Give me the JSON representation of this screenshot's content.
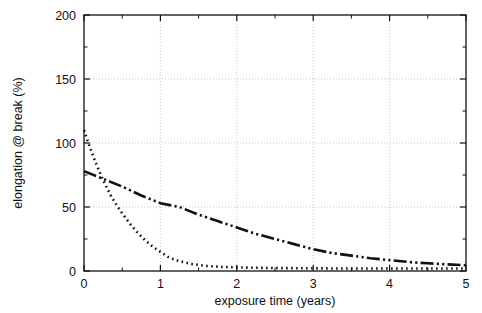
{
  "figure": {
    "clipped_top_text": "",
    "background": "#ffffff",
    "ink": "#111111",
    "grid_color": "#bdbdbd"
  },
  "chart_data": {
    "type": "line",
    "title": "",
    "xlabel": "exposure time (years)",
    "ylabel": "elongation @ break (%)",
    "xlim": [
      0,
      5
    ],
    "ylim": [
      0,
      200
    ],
    "xticks": [
      0,
      1,
      2,
      3,
      4,
      5
    ],
    "xticklabels": [
      "0",
      "1",
      "2",
      "3",
      "4",
      "5"
    ],
    "yticks": [
      0,
      50,
      100,
      150,
      200
    ],
    "yticklabels": [
      "0",
      "50",
      "100",
      "150",
      "200"
    ],
    "grid": true,
    "grid_style": "dotted",
    "gridlines_x": [
      1,
      2,
      3,
      4
    ],
    "gridlines_y": [
      50,
      100,
      150
    ],
    "legend": "none",
    "series": [
      {
        "name": "series-1",
        "linestyle": "dotted",
        "color": "#111111",
        "x": [
          0.0,
          0.05,
          0.1,
          0.15,
          0.2,
          0.25,
          0.3,
          0.35,
          0.4,
          0.5,
          0.6,
          0.7,
          0.8,
          0.9,
          1.0,
          1.1,
          1.2,
          1.4,
          1.6,
          1.8,
          2.0,
          2.25,
          2.5,
          2.75,
          3.0,
          3.25,
          3.5,
          3.75,
          4.0,
          4.25,
          4.5,
          4.75,
          5.0
        ],
        "y": [
          110,
          101,
          93,
          85,
          78,
          71,
          65,
          59,
          54,
          45,
          37,
          30,
          24,
          19,
          15,
          11,
          8.5,
          5.5,
          4.0,
          3.2,
          2.8,
          2.5,
          2.3,
          2.2,
          2.1,
          2.0,
          2.0,
          2.0,
          2.0,
          2.0,
          2.0,
          2.0,
          2.0
        ]
      },
      {
        "name": "series-2",
        "linestyle": "dashdotdot",
        "color": "#111111",
        "x": [
          0.0,
          0.25,
          0.5,
          0.75,
          1.0,
          1.25,
          1.5,
          1.75,
          2.0,
          2.25,
          2.5,
          2.75,
          3.0,
          3.25,
          3.5,
          3.75,
          4.0,
          4.25,
          4.5,
          4.75,
          5.0
        ],
        "y": [
          78,
          72,
          66,
          59,
          53,
          50,
          44,
          39,
          34,
          29,
          25,
          21,
          17,
          14,
          12,
          10,
          8.5,
          7.0,
          6.0,
          5.2,
          4.5
        ]
      }
    ]
  }
}
